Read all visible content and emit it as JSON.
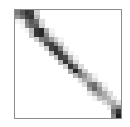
{
  "chart_data": {
    "type": "heatmap",
    "title": "",
    "xlabel": "",
    "ylabel": "",
    "grid": false,
    "colormap": "grayscale (white=0, black=1)",
    "rows": 24,
    "cols": 22,
    "values": [
      [
        0.55,
        0.7,
        0.85,
        0.8,
        0.2,
        0,
        0,
        0,
        0,
        0,
        0,
        0,
        0,
        0,
        0,
        0,
        0,
        0,
        0,
        0,
        0,
        0
      ],
      [
        0.45,
        0.6,
        0.8,
        0.85,
        0.3,
        0,
        0,
        0,
        0,
        0,
        0,
        0,
        0,
        0,
        0,
        0,
        0,
        0,
        0,
        0,
        0,
        0
      ],
      [
        0.05,
        0.1,
        0.55,
        0.7,
        0.6,
        0.15,
        0,
        0,
        0,
        0,
        0,
        0,
        0,
        0,
        0,
        0,
        0,
        0,
        0,
        0,
        0,
        0
      ],
      [
        0,
        0.05,
        0.5,
        0.65,
        0.7,
        0.2,
        0,
        0,
        0,
        0,
        0,
        0,
        0,
        0,
        0,
        0,
        0,
        0,
        0,
        0,
        0,
        0
      ],
      [
        0,
        0,
        0.05,
        0.3,
        0.85,
        0.9,
        0.35,
        0.05,
        0,
        0,
        0,
        0,
        0,
        0,
        0,
        0,
        0,
        0,
        0,
        0,
        0,
        0
      ],
      [
        0,
        0,
        0,
        0.25,
        0.85,
        0.9,
        0.5,
        0.1,
        0,
        0,
        0,
        0,
        0,
        0,
        0,
        0,
        0,
        0,
        0,
        0,
        0,
        0
      ],
      [
        0,
        0,
        0,
        0,
        0.2,
        0.55,
        0.6,
        0.4,
        0.2,
        0.05,
        0,
        0,
        0,
        0,
        0,
        0,
        0,
        0,
        0,
        0,
        0,
        0
      ],
      [
        0,
        0,
        0,
        0,
        0,
        0.15,
        0.75,
        0.8,
        0.5,
        0.2,
        0,
        0,
        0,
        0,
        0,
        0,
        0,
        0,
        0,
        0,
        0,
        0
      ],
      [
        0,
        0,
        0,
        0,
        0,
        0,
        0.2,
        0.8,
        0.85,
        0.55,
        0.1,
        0,
        0,
        0,
        0,
        0,
        0,
        0,
        0,
        0,
        0,
        0
      ],
      [
        0,
        0,
        0,
        0,
        0,
        0,
        0,
        0.3,
        0.85,
        0.8,
        0.35,
        0.05,
        0,
        0,
        0,
        0,
        0,
        0,
        0,
        0,
        0,
        0
      ],
      [
        0,
        0,
        0,
        0,
        0,
        0,
        0,
        0,
        0.25,
        0.8,
        0.75,
        0.3,
        0.05,
        0,
        0,
        0,
        0,
        0,
        0,
        0,
        0,
        0
      ],
      [
        0,
        0,
        0,
        0,
        0,
        0,
        0,
        0,
        0,
        0.3,
        0.85,
        0.55,
        0.15,
        0,
        0,
        0,
        0,
        0,
        0,
        0,
        0,
        0
      ],
      [
        0,
        0,
        0,
        0,
        0,
        0,
        0,
        0,
        0,
        0,
        0.2,
        0.85,
        0.6,
        0.15,
        0,
        0,
        0,
        0,
        0,
        0,
        0,
        0
      ],
      [
        0,
        0,
        0,
        0,
        0,
        0,
        0,
        0,
        0,
        0,
        0,
        0.35,
        0.9,
        0.6,
        0.2,
        0,
        0,
        0,
        0,
        0,
        0,
        0
      ],
      [
        0,
        0,
        0,
        0,
        0,
        0,
        0,
        0,
        0,
        0,
        0,
        0,
        0.3,
        0.55,
        0.45,
        0.25,
        0.05,
        0,
        0,
        0,
        0,
        0
      ],
      [
        0,
        0,
        0,
        0,
        0,
        0,
        0,
        0,
        0,
        0,
        0,
        0,
        0,
        0.15,
        0.35,
        0.3,
        0.15,
        0,
        0,
        0,
        0,
        0
      ],
      [
        0,
        0,
        0,
        0,
        0,
        0,
        0,
        0,
        0,
        0,
        0,
        0,
        0,
        0,
        0.15,
        0.55,
        0.6,
        0.3,
        0.05,
        0,
        0,
        0
      ],
      [
        0,
        0,
        0,
        0,
        0,
        0,
        0,
        0,
        0,
        0,
        0,
        0,
        0,
        0,
        0,
        0.4,
        0.65,
        0.45,
        0.15,
        0,
        0,
        0
      ],
      [
        0,
        0,
        0,
        0,
        0,
        0,
        0,
        0,
        0,
        0,
        0,
        0,
        0,
        0,
        0,
        0.1,
        0.3,
        0.45,
        0.35,
        0.15,
        0,
        0
      ],
      [
        0,
        0,
        0,
        0,
        0,
        0,
        0,
        0,
        0,
        0,
        0,
        0,
        0,
        0,
        0,
        0,
        0.05,
        0.25,
        0.35,
        0.3,
        0.1,
        0
      ],
      [
        0,
        0,
        0,
        0,
        0,
        0,
        0,
        0,
        0,
        0,
        0,
        0,
        0,
        0,
        0,
        0,
        0,
        0,
        0.15,
        0.3,
        0.35,
        0.15
      ],
      [
        0,
        0,
        0,
        0,
        0,
        0,
        0,
        0,
        0,
        0,
        0,
        0,
        0,
        0,
        0,
        0,
        0,
        0,
        0,
        0.1,
        0.45,
        0.5
      ],
      [
        0,
        0,
        0,
        0,
        0,
        0,
        0,
        0,
        0,
        0,
        0,
        0,
        0,
        0,
        0,
        0,
        0,
        0,
        0,
        0,
        0.6,
        0.85
      ],
      [
        0,
        0,
        0,
        0,
        0,
        0,
        0,
        0,
        0,
        0,
        0,
        0,
        0,
        0,
        0,
        0,
        0,
        0,
        0,
        0,
        0.5,
        0.95
      ]
    ]
  },
  "colors": {
    "frame": "#8c8c8c",
    "low": "#ffffff",
    "high": "#111111"
  }
}
